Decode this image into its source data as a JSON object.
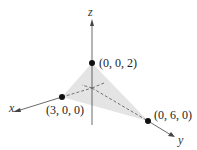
{
  "diagram": {
    "title": "",
    "axes": {
      "x": "x",
      "y": "y",
      "z": "z"
    },
    "points": [
      {
        "label": "(0, 0, 2)",
        "coords": [
          0,
          0,
          2
        ]
      },
      {
        "label": "(3, 0, 0)",
        "coords": [
          3,
          0,
          0
        ]
      },
      {
        "label": "(0, 6, 0)",
        "coords": [
          0,
          6,
          0
        ]
      }
    ],
    "shaded_region": "triangle through (3,0,0), (0,6,0), (0,0,2)",
    "colors": {
      "fill": "#e4e4e4",
      "axis": "#444444",
      "point": "#111111"
    }
  }
}
